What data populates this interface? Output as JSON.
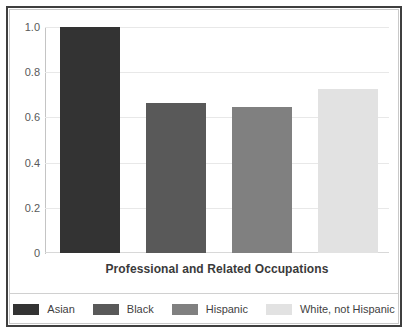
{
  "chart_data": {
    "type": "bar",
    "title": "",
    "subtitle": "",
    "xlabel": "Professional and Related Occupations",
    "ylabel": "",
    "categories": [
      "Asian",
      "Black",
      "Hispanic",
      "White, not Hispanic"
    ],
    "values": [
      1.0,
      0.665,
      0.645,
      0.725
    ],
    "ylim": [
      0,
      1.0
    ],
    "ytick_labels": [
      "1.0",
      "0.8",
      "0.6",
      "0.4",
      "0.2",
      "0"
    ],
    "ytick_values": [
      1.0,
      0.8,
      0.6,
      0.4,
      0.2,
      0
    ],
    "grid": true,
    "legend_position": "bottom",
    "series": [
      {
        "name": "Asian",
        "value": 1.0,
        "color": "#333333"
      },
      {
        "name": "Black",
        "value": 0.665,
        "color": "#595959"
      },
      {
        "name": "Hispanic",
        "value": 0.645,
        "color": "#808080"
      },
      {
        "name": "White, not Hispanic",
        "value": 0.725,
        "color": "#e2e2e2"
      }
    ]
  },
  "axis": {
    "y_ticks": [
      {
        "label": "1.0",
        "value": 1.0
      },
      {
        "label": "0.8",
        "value": 0.8
      },
      {
        "label": "0.6",
        "value": 0.6
      },
      {
        "label": "0.4",
        "value": 0.4
      },
      {
        "label": "0.2",
        "value": 0.2
      },
      {
        "label": "0",
        "value": 0
      }
    ],
    "x_title": "Professional and Related Occupations"
  },
  "legend": {
    "items": [
      {
        "label": "Asian",
        "color": "#333333"
      },
      {
        "label": "Black",
        "color": "#595959"
      },
      {
        "label": "Hispanic",
        "color": "#808080"
      },
      {
        "label": "White, not Hispanic",
        "color": "#e2e2e2"
      }
    ]
  },
  "colors": {
    "frame": "#3f3f3f",
    "grid": "#e8e8e8",
    "tick_text": "#595959",
    "title_text": "#3a3a3a",
    "background": "#ffffff"
  }
}
